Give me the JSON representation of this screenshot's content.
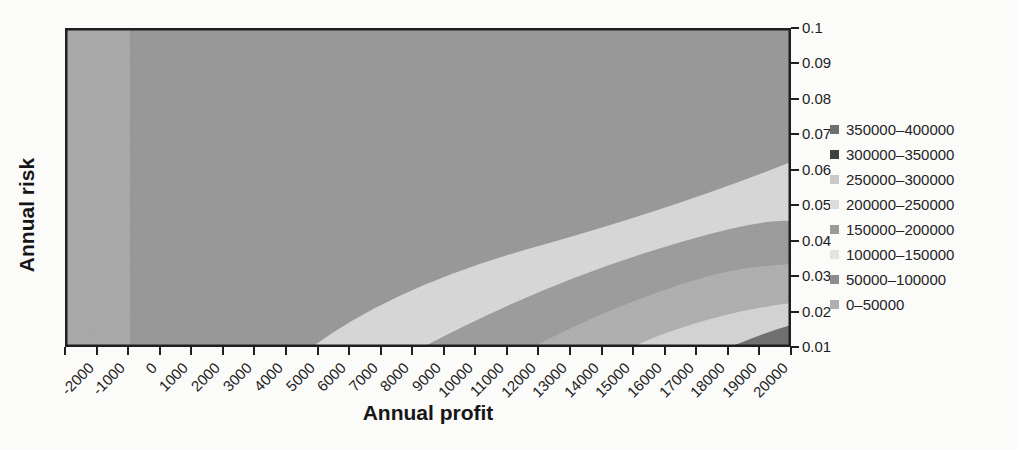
{
  "figure": {
    "x_axis": {
      "title": "Annual profit",
      "tick_labels": [
        "-2000",
        "-1000",
        "0",
        "1000",
        "2000",
        "3000",
        "4000",
        "5000",
        "6000",
        "7000",
        "8000",
        "9000",
        "10000",
        "11000",
        "12000",
        "13000",
        "14000",
        "15000",
        "16000",
        "17000",
        "18000",
        "19000",
        "20000"
      ]
    },
    "y_axis": {
      "title": "Annual risk",
      "tick_labels": [
        "0.1",
        "0.09",
        "0.08",
        "0.07",
        "0.06",
        "0.05",
        "0.04",
        "0.03",
        "0.02",
        "0.01"
      ]
    },
    "legend": {
      "items": [
        {
          "label": "350000–400000",
          "color": "#6e6e6e"
        },
        {
          "label": "300000–350000",
          "color": "#404040"
        },
        {
          "label": "250000–300000",
          "color": "#c9c9c9"
        },
        {
          "label": "200000–250000",
          "color": "#dcdcdc"
        },
        {
          "label": "150000–200000",
          "color": "#9b9b9b"
        },
        {
          "label": "100000–150000",
          "color": "#e3e3e3"
        },
        {
          "label": "50000–100000",
          "color": "#8c8c8c"
        },
        {
          "label": "0–50000",
          "color": "#b0b0b0"
        }
      ]
    }
  },
  "plot": {
    "background": "#969696",
    "border_color": "#1f1f1f",
    "left_strip": {
      "x": 0,
      "width": 65,
      "color": "#a7a7a7"
    },
    "bands": [
      {
        "range": "100000–150000",
        "color": "#d8d8d8",
        "path": "M247,319 Q330,258 470,219 T726,134 L726,319 Z"
      },
      {
        "range": "150000–200000",
        "color": "#9a9a9a",
        "path": "M358,319 Q470,260 580,225 T726,193 L726,319 Z"
      },
      {
        "range": "200000–250000",
        "color": "#aeaeae",
        "path": "M468,319 C520,292 575,268 640,249 C680,238 705,238 726,236 L726,319 Z"
      },
      {
        "range": "250000–300000",
        "color": "#d4d4d4",
        "path": "M568,319 C595,305 660,283 726,275 L726,319 Z"
      },
      {
        "range": "350000–400000",
        "color": "#6b6b6b",
        "path": "M665,319 C685,311 705,303 726,297 L726,319 Z"
      }
    ]
  },
  "chart_data": {
    "type": "heatmap",
    "subtype": "filled contour surface chart (top view), grayscale scan",
    "title": "",
    "xlabel": "Annual profit",
    "ylabel": "Annual risk",
    "x_ticks": [
      -2000,
      -1000,
      0,
      1000,
      2000,
      3000,
      4000,
      5000,
      6000,
      7000,
      8000,
      9000,
      10000,
      11000,
      12000,
      13000,
      14000,
      15000,
      16000,
      17000,
      18000,
      19000,
      20000
    ],
    "y_ticks": [
      0.1,
      0.09,
      0.08,
      0.07,
      0.06,
      0.05,
      0.04,
      0.03,
      0.02,
      0.01
    ],
    "x_range": [
      -2000,
      20000
    ],
    "y_range": [
      0.01,
      0.1
    ],
    "z_range": [
      0,
      400000
    ],
    "z_band_width": 50000,
    "y_axis_side": "right",
    "legend_position": "right",
    "legend_entries": [
      "350000–400000",
      "300000–350000",
      "250000–300000",
      "200000–250000",
      "150000–200000",
      "100000–150000",
      "50000–100000",
      "0–50000"
    ],
    "bands_visible": [
      {
        "range": "0–50000",
        "region": "vertical strip at far left covering profit < 0 (categories -2000 and -1000), slightly lighter gray"
      },
      {
        "range": "50000–100000",
        "region": "dominant medium-gray area covering most of the plot"
      },
      {
        "range": "100000–150000",
        "region": "bright curved band: crosses bottom edge (risk 0.01) near profit 5700, rises to right edge at risk about 0.062"
      },
      {
        "range": "150000–200000",
        "region": "medium-gray curved band: bottom edge near profit 9300, right edge at risk about 0.045"
      },
      {
        "range": "200000–250000",
        "region": "medium-light curved band: bottom edge near profit 12800, right edge at risk about 0.033"
      },
      {
        "range": "250000–300000",
        "region": "bright curved band: bottom edge near profit 15900, right edge at risk about 0.023"
      },
      {
        "range": "350000–400000",
        "region": "dark wedge in bottom-right corner: bottom edge near profit 19000, right edge below risk about 0.017"
      }
    ]
  }
}
